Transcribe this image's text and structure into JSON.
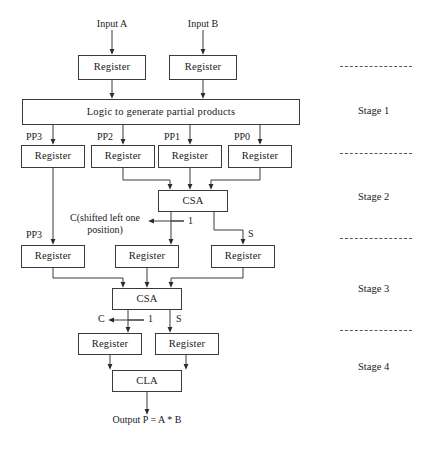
{
  "diagram": {
    "inputs": [
      {
        "name": "input-a",
        "label": "Input A"
      },
      {
        "name": "input-b",
        "label": "Input B"
      }
    ],
    "blocks": {
      "register": "Register",
      "logic": "Logic to generate partial products",
      "csa": "CSA",
      "cla": "CLA"
    },
    "registers": {
      "input_a_reg": "Register",
      "input_b_reg": "Register",
      "pp3_reg_s1": "Register",
      "pp2_reg_s1": "Register",
      "pp1_reg_s1": "Register",
      "pp0_reg_s1": "Register",
      "pp3_reg_s2": "Register",
      "c_reg_s2": "Register",
      "s_reg_s2": "Register",
      "c_reg_s3": "Register",
      "s_reg_s3": "Register"
    },
    "adders": {
      "csa_stage2": "CSA",
      "csa_stage3": "CSA",
      "cla_stage4": "CLA"
    },
    "signals": {
      "pp3_top": "PP3",
      "pp2": "PP2",
      "pp1": "PP1",
      "pp0": "PP0",
      "pp3_mid": "PP3",
      "c_shifted": "C(shifted left one position)",
      "shift_amount_1": "1",
      "s_stage2": "S",
      "c_stage3": "C",
      "shift_amount_1_b": "1",
      "s_stage3": "S"
    },
    "output": {
      "label": "Output P = A * B"
    },
    "stages": [
      {
        "name": "stage-1",
        "label": "Stage 1"
      },
      {
        "name": "stage-2",
        "label": "Stage 2"
      },
      {
        "name": "stage-3",
        "label": "Stage 3"
      },
      {
        "name": "stage-4",
        "label": "Stage 4"
      }
    ],
    "colors": {
      "line": "#3a3a3a",
      "text": "#1a1a1a",
      "background": "#ffffff",
      "separator": "#555555"
    }
  }
}
